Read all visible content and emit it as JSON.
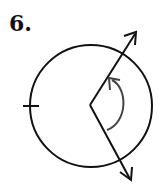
{
  "problem": {
    "number_label": "6."
  },
  "figure": {
    "type": "circle-with-angle",
    "circle": {
      "cx": 91,
      "cy": 106,
      "r": 61
    },
    "vertex": {
      "x": 90,
      "y": 105
    },
    "rays": [
      {
        "name": "upper-ray",
        "end": {
          "x": 136,
          "y": 32
        }
      },
      {
        "name": "lower-ray",
        "end": {
          "x": 131,
          "y": 180
        }
      }
    ],
    "tick_mark": {
      "x": 30,
      "y": 106
    },
    "angle_arc": {
      "direction": "counterclockwise",
      "color": "#444444"
    },
    "stroke_color": "#111111"
  }
}
